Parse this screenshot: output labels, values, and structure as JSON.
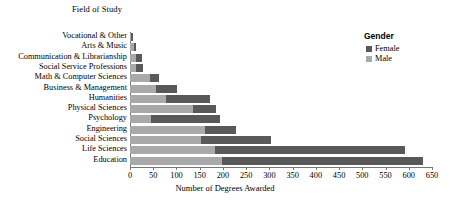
{
  "chart_data": {
    "type": "bar",
    "orientation": "horizontal",
    "stacked": true,
    "title": "",
    "ylabel": "Field of Study",
    "xlabel": "Number of Degrees Awarded",
    "xlim": [
      0,
      650
    ],
    "xticks": [
      0,
      50,
      100,
      150,
      200,
      250,
      300,
      350,
      400,
      450,
      500,
      550,
      600,
      650
    ],
    "grid": false,
    "legend": {
      "title": "Gender",
      "position": "top-right",
      "entries": [
        {
          "name": "Female",
          "color": "#595959"
        },
        {
          "name": "Male",
          "color": "#a9a9a9"
        }
      ]
    },
    "categories": [
      "Vocational & Other",
      "Arts & Music",
      "Communication & Librarianship",
      "Social Service Professions",
      "Math & Computer Sciences",
      "Business & Management",
      "Humanities",
      "Physical Sciences",
      "Psychology",
      "Engineering",
      "Social Sciences",
      "Life Sciences",
      "Education"
    ],
    "series": [
      {
        "name": "Male",
        "color": "#a9a9a9",
        "values": [
          2,
          8,
          12,
          12,
          44,
          56,
          78,
          135,
          45,
          162,
          153,
          182,
          197
        ]
      },
      {
        "name": "Female",
        "color": "#595959",
        "values": [
          4,
          5,
          14,
          15,
          18,
          45,
          94,
          50,
          148,
          66,
          151,
          410,
          433
        ]
      }
    ],
    "totals": [
      6,
      13,
      26,
      27,
      62,
      101,
      172,
      185,
      193,
      228,
      304,
      592,
      630
    ]
  },
  "colors": {
    "female": "#595959",
    "male": "#a9a9a9",
    "axis": "#777777",
    "background": "#ffffff"
  }
}
